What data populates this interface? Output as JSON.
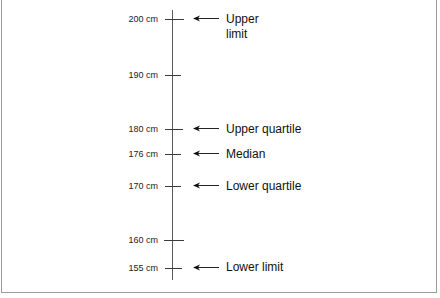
{
  "diagram": {
    "type": "box-plot-scale",
    "units": "cm",
    "axis": {
      "min": 155,
      "max": 200
    },
    "ticks": [
      {
        "value": 200,
        "label": "200 cm",
        "y": 19,
        "tick_left": 165,
        "tick_right": 184
      },
      {
        "value": 190,
        "label": "190 cm",
        "y": 75,
        "tick_left": 165,
        "tick_right": 181
      },
      {
        "value": 180,
        "label": "180 cm",
        "y": 129,
        "tick_left": 165,
        "tick_right": 183
      },
      {
        "value": 176,
        "label": "176 cm",
        "y": 154,
        "tick_left": 165,
        "tick_right": 181
      },
      {
        "value": 170,
        "label": "170 cm",
        "y": 186,
        "tick_left": 165,
        "tick_right": 181
      },
      {
        "value": 160,
        "label": "160 cm",
        "y": 240,
        "tick_left": 164,
        "tick_right": 184
      },
      {
        "value": 155,
        "label": "155 cm",
        "y": 268,
        "tick_left": 165,
        "tick_right": 182
      }
    ],
    "callouts": [
      {
        "value": 200,
        "line1": "Upper",
        "line2": "limit",
        "y": 19,
        "icon": "left-arrow-icon"
      },
      {
        "value": 180,
        "line1": "Upper quartile",
        "y": 129,
        "icon": "left-arrow-icon"
      },
      {
        "value": 176,
        "line1": "Median",
        "y": 154,
        "icon": "left-arrow-icon"
      },
      {
        "value": 170,
        "line1": "Lower quartile",
        "y": 186,
        "icon": "left-arrow-icon"
      },
      {
        "value": 155,
        "line1": "Lower limit",
        "y": 268,
        "icon": "left-arrow-icon"
      }
    ],
    "colors": {
      "line": "#3a3a3a",
      "text": "#111111",
      "border": "#9a9a9a",
      "background": "#ffffff"
    }
  }
}
